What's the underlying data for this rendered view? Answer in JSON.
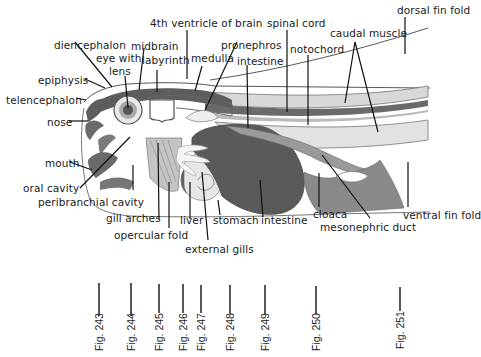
{
  "diagram": {
    "type": "anatomical-section",
    "colors": {
      "dark_tissue": "#5a5a5a",
      "mid_tissue": "#8c8c8c",
      "light_tissue": "#cfcfcf",
      "outline": "#333333",
      "background": "#ffffff"
    },
    "labels": {
      "ventricle4": "4th ventricle of brain",
      "spinal_cord": "spinal cord",
      "dorsal_fin_fold": "dorsal fin fold",
      "diencephalon": "diencephalon",
      "midbrain": "midbrain",
      "pronephros": "pronephros",
      "caudal_muscle": "caudal muscle",
      "eye_with": "eye with",
      "lens": "lens",
      "labyrinth": "labyrinth",
      "medulla": "medulla",
      "notochord": "notochord",
      "intestine_top": "intestine",
      "epiphysis": "epiphysis",
      "telencephalon": "telencephalon",
      "nose": "nose",
      "mouth": "mouth",
      "oral_cavity": "oral cavity",
      "peribranchial_cavity": "peribranchial cavity",
      "gill_arches": "gill arches",
      "liver": "liver",
      "stomach": "stomach",
      "intestine_bottom": "intestine",
      "cloaca": "cloaca",
      "ventral_fin_fold": "ventral fin fold",
      "opercular_fold": "opercular fold",
      "mesonephric_duct": "mesonephric duct",
      "external_gills": "external gills"
    },
    "figure_markers": [
      {
        "label": "Fig. 243",
        "x": 99
      },
      {
        "label": "Fig. 244",
        "x": 131
      },
      {
        "label": "Fig. 245",
        "x": 159
      },
      {
        "label": "Fig. 246",
        "x": 183
      },
      {
        "label": "Fig. 247",
        "x": 201
      },
      {
        "label": "Fig. 248",
        "x": 230
      },
      {
        "label": "Fig. 249",
        "x": 265
      },
      {
        "label": "Fig. 250",
        "x": 316
      },
      {
        "label": "Fig. 251",
        "x": 400
      }
    ]
  }
}
